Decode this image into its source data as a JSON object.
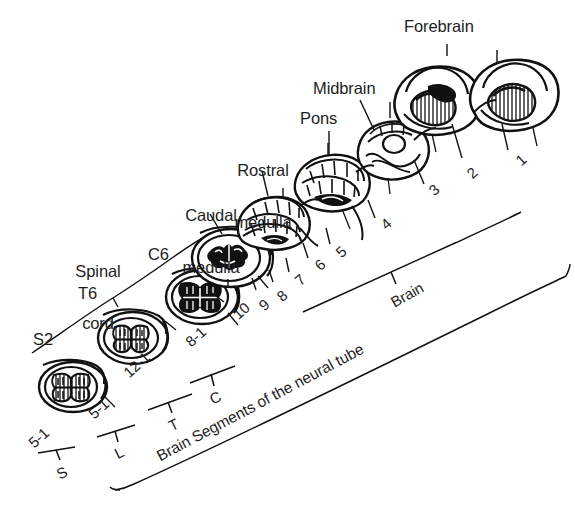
{
  "figure": {
    "title": "Brain Segments of the neural tube",
    "caption": "Brain Segments of the neural tube",
    "style": "black ink line drawing on white background",
    "ink_color": "#1a1a1a",
    "background_color": "#ffffff"
  },
  "structure_labels": [
    {
      "id": "forebrain",
      "text": "Forebrain"
    },
    {
      "id": "midbrain",
      "text": "Midbrain"
    },
    {
      "id": "pons",
      "text": "Pons"
    },
    {
      "id": "rostral-medulla",
      "line1": "Rostral",
      "line2": "medulla"
    },
    {
      "id": "caudal-medulla",
      "line1": "Caudal",
      "line2": "medulla"
    },
    {
      "id": "spinal-cord",
      "line1": "Spinal",
      "line2": "cord"
    }
  ],
  "level_labels": [
    {
      "id": "c6",
      "text": "C6"
    },
    {
      "id": "t6",
      "text": "T6"
    },
    {
      "id": "s2",
      "text": "S2"
    }
  ],
  "segment_numbers": {
    "brain": [
      "1",
      "2",
      "3",
      "4",
      "5",
      "6",
      "7",
      "8",
      "9",
      "10"
    ],
    "cervical_range": "8-1",
    "thoracic_range": "12-1",
    "lumbar_range": "5-1",
    "sacral_range": "5-1"
  },
  "brackets": [
    {
      "id": "bracket-s",
      "label": "S",
      "range": "5-1"
    },
    {
      "id": "bracket-l",
      "label": "L",
      "range": "5-1"
    },
    {
      "id": "bracket-t",
      "label": "T",
      "range": "12-1"
    },
    {
      "id": "bracket-c",
      "label": "C",
      "range": "8-1"
    },
    {
      "id": "bracket-brain",
      "label": "Brain",
      "range": "10-1"
    },
    {
      "id": "bracket-all",
      "label": "Brain Segments of the neural tube",
      "range": ""
    }
  ]
}
